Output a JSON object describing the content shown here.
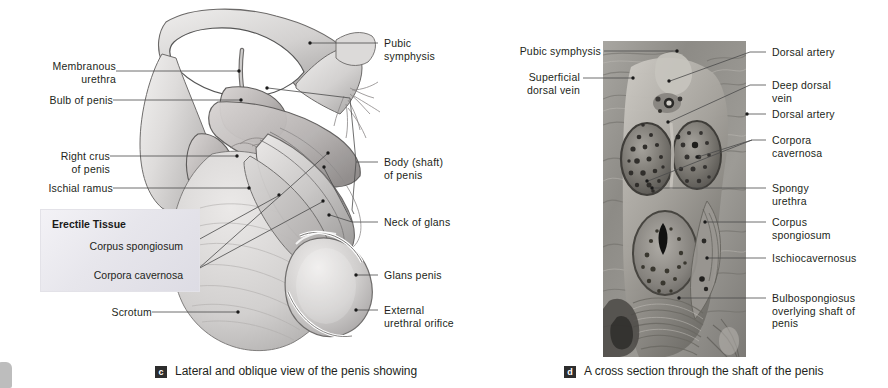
{
  "figure": {
    "panels": [
      {
        "id": "c",
        "badge": "c",
        "caption": "Lateral and oblique view of the penis showing",
        "type": "illustration",
        "labels_left": [
          {
            "name": "membranous-urethra",
            "text": "Membranous\nurethra"
          },
          {
            "name": "bulb-of-penis",
            "text": "Bulb of penis"
          },
          {
            "name": "right-crus-of-penis",
            "text": "Right crus\nof penis"
          },
          {
            "name": "ischial-ramus",
            "text": "Ischial ramus"
          },
          {
            "name": "scrotum",
            "text": "Scrotum"
          }
        ],
        "labels_right": [
          {
            "name": "pubic-symphysis",
            "text": "Pubic\nsymphysis"
          },
          {
            "name": "body-shaft-of-penis",
            "text": "Body (shaft)\nof penis"
          },
          {
            "name": "neck-of-glans",
            "text": "Neck of glans"
          },
          {
            "name": "glans-penis",
            "text": "Glans penis"
          },
          {
            "name": "external-urethral-orifice",
            "text": "External\nurethral orifice"
          }
        ],
        "callout_box": {
          "title": "Erectile Tissue",
          "rows": [
            {
              "name": "corpus-spongiosum",
              "text": "Corpus spongiosum"
            },
            {
              "name": "corpora-cavernosa",
              "text": "Corpora cavernosa"
            }
          ]
        }
      },
      {
        "id": "d",
        "badge": "d",
        "caption": "A cross section through the shaft of the penis",
        "type": "photograph",
        "labels_left": [
          {
            "name": "pubic-symphysis",
            "text": "Pubic symphysis"
          },
          {
            "name": "superficial-dorsal-vein",
            "text": "Superficial\ndorsal vein"
          }
        ],
        "labels_right": [
          {
            "name": "dorsal-artery-upper",
            "text": "Dorsal artery"
          },
          {
            "name": "deep-dorsal-vein",
            "text": "Deep dorsal\nvein"
          },
          {
            "name": "dorsal-artery-lower",
            "text": "Dorsal artery"
          },
          {
            "name": "corpora-cavernosa",
            "text": "Corpora\ncavernosa"
          },
          {
            "name": "spongy-urethra",
            "text": "Spongy\nurethra"
          },
          {
            "name": "corpus-spongiosum",
            "text": "Corpus\nspongiosum"
          },
          {
            "name": "ischiocavernosus",
            "text": "Ischiocavernosus"
          },
          {
            "name": "bulbospongiosus",
            "text": "Bulbospongiosus\noverlying shaft of\npenis"
          }
        ]
      }
    ]
  },
  "style": {
    "background": "#ffffff",
    "text_color": "#231f20",
    "leader_color": "#4a4a4a",
    "badge_bg": "#2d2d2d",
    "badge_fg": "#ffffff",
    "callout_bg": "#e9e8ee"
  }
}
